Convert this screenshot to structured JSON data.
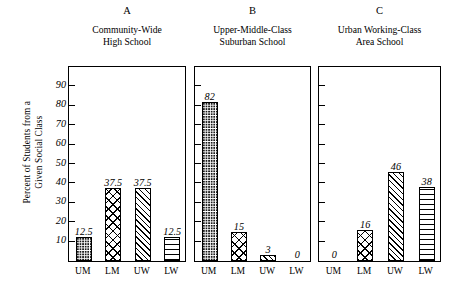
{
  "chart_data": {
    "type": "bar",
    "title": "",
    "xlabel": "",
    "ylabel": "Percent of Students from a\nGiven Social Class",
    "ylim": [
      0,
      100
    ],
    "yticks": [
      10,
      20,
      30,
      40,
      50,
      60,
      70,
      80,
      90
    ],
    "ytick_labels": [
      "10",
      "20",
      "30",
      "40",
      "50",
      "60",
      "70",
      "80",
      "90"
    ],
    "grid": false,
    "legend": "none",
    "categories": [
      "UM",
      "LM",
      "UW",
      "LW"
    ],
    "category_names": [
      "Upper-Middle",
      "Lower-Middle",
      "Upper-Working",
      "Lower-Working"
    ],
    "panels": [
      {
        "letter": "A",
        "title": "Community-Wide\nHigh School",
        "values": [
          12.5,
          37.5,
          37.5,
          12.5
        ],
        "labels": [
          "12.5",
          "37.5",
          "37.5",
          "12.5"
        ],
        "patterns": [
          "dots",
          "crosshatch",
          "diagonal",
          "horizontal"
        ]
      },
      {
        "letter": "B",
        "title": "Upper-Middle-Class\nSuburban School",
        "values": [
          82,
          15,
          3,
          0
        ],
        "labels": [
          "82",
          "15",
          "3",
          "0"
        ],
        "patterns": [
          "dots",
          "crosshatch",
          "diagonal",
          "horizontal"
        ]
      },
      {
        "letter": "C",
        "title": "Urban Working-Class\nArea School",
        "values": [
          0,
          16,
          46,
          38
        ],
        "labels": [
          "0",
          "16",
          "46",
          "38"
        ],
        "patterns": [
          "dots",
          "crosshatch",
          "diagonal",
          "horizontal"
        ]
      }
    ]
  }
}
